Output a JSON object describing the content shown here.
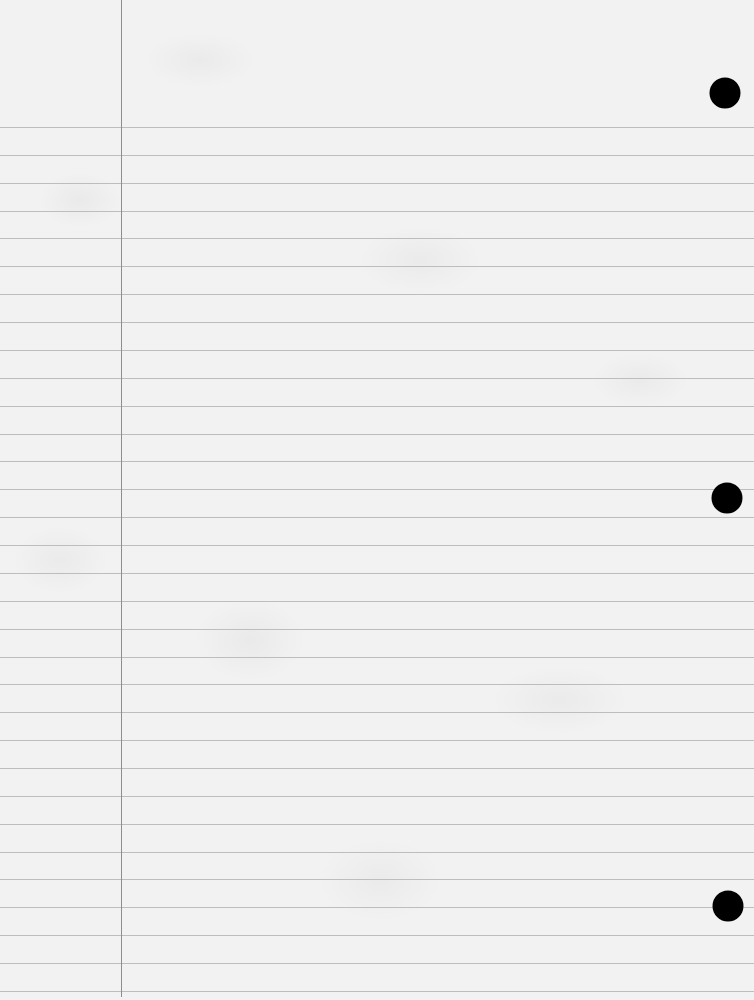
{
  "page": {
    "type": "lined-notebook-paper",
    "colors": {
      "paper": "#f2f2f2",
      "rule": "#bdbdbd",
      "margin_line": "#8e8e8e",
      "hole": "#000000"
    },
    "margin_line_x": 121,
    "rules": {
      "first_y": 127,
      "spacing": 27.87,
      "count": 32
    },
    "holes": [
      {
        "cx": 725,
        "cy": 93
      },
      {
        "cx": 727,
        "cy": 498
      },
      {
        "cx": 728,
        "cy": 906
      }
    ],
    "text": []
  }
}
